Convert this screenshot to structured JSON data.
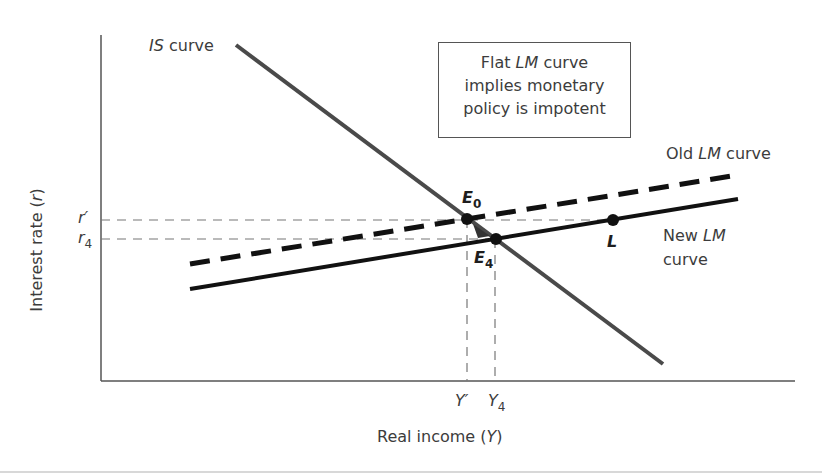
{
  "diagram": {
    "type": "IS-LM diagram",
    "axes": {
      "y_label_prefix": "Interest rate (",
      "y_label_var": "r",
      "y_label_suffix": ")",
      "x_label_prefix": "Real income (",
      "x_label_var": "Y",
      "x_label_suffix": ")"
    },
    "y_ticks": [
      {
        "base": "r",
        "mark": "′",
        "sub": ""
      },
      {
        "base": "r",
        "mark": "",
        "sub": "4"
      }
    ],
    "x_ticks": [
      {
        "base": "Y",
        "mark": "′",
        "sub": ""
      },
      {
        "base": "Y",
        "mark": "",
        "sub": "4"
      }
    ],
    "curves": {
      "is": {
        "italic": "IS",
        "rest": " curve"
      },
      "old_lm": {
        "pre": "Old ",
        "italic": "LM",
        "rest": " curve"
      },
      "new_lm": {
        "pre": "New ",
        "italic": "LM",
        "line2": "curve"
      }
    },
    "points": {
      "e0": {
        "base": "E",
        "sub": "0"
      },
      "e4": {
        "base": "E",
        "sub": "4"
      },
      "l": {
        "base": "L"
      }
    },
    "note": {
      "line1_pre": "Flat ",
      "line1_italic": "LM",
      "line1_rest": " curve",
      "line2": "implies monetary",
      "line3": "policy is impotent"
    },
    "colors": {
      "is_line": "#4a4a4a",
      "lm_line": "#111111",
      "axis": "#555555",
      "guide_dash": "#777777"
    }
  }
}
